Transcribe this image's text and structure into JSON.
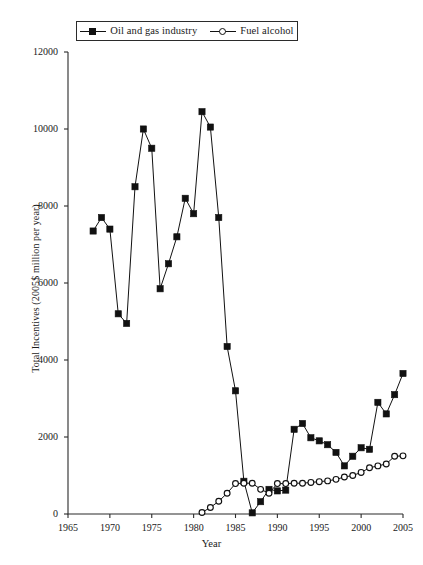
{
  "chart_data": {
    "type": "line",
    "title": "",
    "xlabel": "Year",
    "ylabel": "Total Incentives (2005$ million per year)",
    "xlim": [
      1965,
      2005
    ],
    "ylim": [
      0,
      12000
    ],
    "xticks": [
      1965,
      1970,
      1975,
      1980,
      1985,
      1990,
      1995,
      2000,
      2005
    ],
    "yticks": [
      0,
      2000,
      4000,
      6000,
      8000,
      10000,
      12000
    ],
    "grid": false,
    "legend_position": "top-center",
    "series": [
      {
        "name": "Oil and gas industry",
        "marker": "filled-square",
        "x": [
          1968,
          1969,
          1970,
          1971,
          1972,
          1973,
          1974,
          1975,
          1976,
          1977,
          1978,
          1979,
          1980,
          1981,
          1982,
          1983,
          1984,
          1985,
          1986,
          1987,
          1988,
          1989,
          1990,
          1991,
          1992,
          1993,
          1994,
          1995,
          1996,
          1997,
          1998,
          1999,
          2000,
          2001,
          2002,
          2003,
          2004,
          2005
        ],
        "values": [
          7350,
          7700,
          7400,
          5200,
          4950,
          8500,
          10000,
          9500,
          5850,
          6500,
          7200,
          8200,
          7800,
          10450,
          10050,
          7700,
          4350,
          3200,
          850,
          30,
          320,
          640,
          600,
          620,
          2200,
          2350,
          1980,
          1900,
          1800,
          1600,
          1250,
          1500,
          1720,
          1680,
          2900,
          2600,
          3100,
          3650
        ]
      },
      {
        "name": "Fuel alcohol",
        "marker": "open-circle",
        "x": [
          1981,
          1982,
          1983,
          1984,
          1985,
          1986,
          1987,
          1988,
          1989,
          1990,
          1991,
          1992,
          1993,
          1994,
          1995,
          1996,
          1997,
          1998,
          1999,
          2000,
          2001,
          2002,
          2003,
          2004,
          2005
        ],
        "values": [
          40,
          170,
          330,
          540,
          790,
          800,
          800,
          640,
          540,
          790,
          790,
          800,
          800,
          820,
          840,
          860,
          900,
          960,
          1000,
          1080,
          1200,
          1250,
          1300,
          1500,
          1510
        ]
      }
    ]
  },
  "legend": {
    "entries": [
      {
        "label": "Oil and gas industry",
        "marker": "filled-square"
      },
      {
        "label": "Fuel alcohol",
        "marker": "open-circle"
      }
    ]
  },
  "axes": {
    "x_title": "Year",
    "y_title": "Total Incentives (2005$ million per year)",
    "x_tick_labels": [
      "1965",
      "1970",
      "1975",
      "1980",
      "1985",
      "1990",
      "1995",
      "2000",
      "2005"
    ],
    "y_tick_labels": [
      "0",
      "2000",
      "4000",
      "6000",
      "8000",
      "10000",
      "12000"
    ]
  },
  "colors": {
    "line": "#111111",
    "axis": "#2b2b2b",
    "background": "#ffffff"
  }
}
